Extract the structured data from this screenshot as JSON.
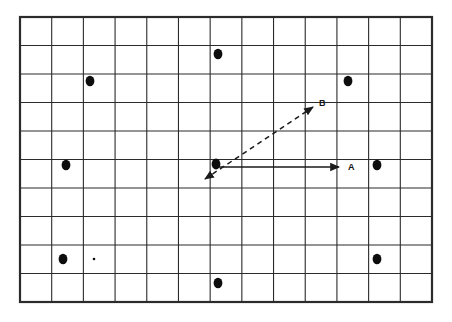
{
  "figure": {
    "title": "",
    "background_color": "#ffffff",
    "line_color": "#2b2b2b",
    "dot_color": "#0d0d0d",
    "grid": {
      "columns": 13,
      "rows": 10,
      "x": 20,
      "y": 17,
      "width": 412,
      "height": 285,
      "cell_width": 31.69,
      "cell_height": 28.5,
      "border_width": 2.2,
      "inner_line_width": 1.1
    },
    "dots": [
      {
        "name": "dot-1",
        "x": 218,
        "y": 54,
        "rx": 4.4,
        "ry": 5.2
      },
      {
        "name": "dot-2",
        "x": 90,
        "y": 81,
        "rx": 4.4,
        "ry": 5.2
      },
      {
        "name": "dot-3",
        "x": 348,
        "y": 81,
        "rx": 4.4,
        "ry": 5.2
      },
      {
        "name": "dot-4",
        "x": 66,
        "y": 165,
        "rx": 4.4,
        "ry": 5.2
      },
      {
        "name": "dot-origin",
        "x": 216,
        "y": 164,
        "rx": 4.4,
        "ry": 5.4
      },
      {
        "name": "dot-5",
        "x": 377,
        "y": 165,
        "rx": 4.4,
        "ry": 5.2
      },
      {
        "name": "dot-6",
        "x": 63,
        "y": 259,
        "rx": 4.4,
        "ry": 5.2
      },
      {
        "name": "dot-7",
        "x": 377,
        "y": 259,
        "rx": 4.4,
        "ry": 5.2
      },
      {
        "name": "dot-8",
        "x": 218,
        "y": 283,
        "rx": 4.4,
        "ry": 5.2
      },
      {
        "name": "dot-speck",
        "x": 94,
        "y": 259,
        "rx": 1.3,
        "ry": 1.3
      }
    ],
    "vectors": [
      {
        "name": "vector-a",
        "label": "A",
        "style": "solid",
        "x1": 218,
        "y1": 167,
        "x2": 339,
        "y2": 167,
        "label_x": 348,
        "label_y": 163,
        "stroke_width": 1.4
      },
      {
        "name": "vector-b",
        "label": "B",
        "style": "dashed",
        "x1": 205,
        "y1": 179,
        "x2": 313,
        "y2": 107,
        "label_x": 319,
        "label_y": 99,
        "stroke_width": 1.5,
        "dash_pattern": "5 4",
        "double_headed": true
      }
    ]
  }
}
